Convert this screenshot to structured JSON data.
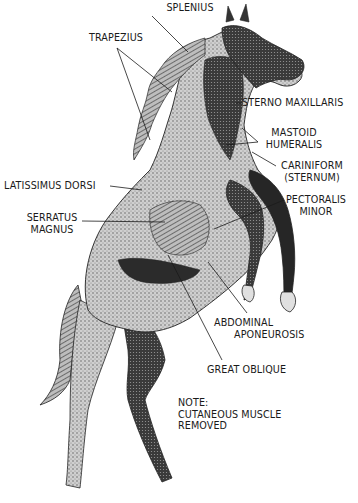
{
  "diagram": {
    "colors": {
      "background": "#ffffff",
      "ink": "#1a1a1a",
      "dark_shade": "#2a2a2a",
      "mid_shade": "#8a8a8a",
      "light_shade": "#d4d4d4"
    },
    "labels": {
      "splenius": "SPLENIUS",
      "trapezius": "TRAPEZIUS",
      "sterno_maxillaris": "STERNO MAXILLARIS",
      "mastoid_humeralis_1": "MASTOID",
      "mastoid_humeralis_2": "HUMERALIS",
      "cariniform_1": "CARINIFORM",
      "cariniform_2": "(STERNUM)",
      "latissimus_dorsi": "LATISSIMUS DORSI",
      "pectoralis_minor_1": "PECTORALIS",
      "pectoralis_minor_2": "MINOR",
      "serratus_magnus_1": "SERRATUS",
      "serratus_magnus_2": "MAGNUS",
      "abdominal_aponeurosis_1": "ABDOMINAL",
      "abdominal_aponeurosis_2": "APONEUROSIS",
      "great_oblique": "GREAT OBLIQUE"
    },
    "note": {
      "line1": "NOTE:",
      "line2": "CUTANEOUS MUSCLE",
      "line3": "REMOVED"
    }
  }
}
